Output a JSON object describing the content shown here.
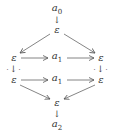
{
  "diagram": {
    "nodes": [
      {
        "id": "a0",
        "label": "a",
        "sub": "0",
        "x": 57,
        "y": 10
      },
      {
        "id": "eps_top",
        "label": "ε",
        "x": 57,
        "y": 30
      },
      {
        "id": "eps_l1",
        "label": "ε",
        "x": 14,
        "y": 58
      },
      {
        "id": "a1_top",
        "label": "a",
        "sub": "1",
        "x": 57,
        "y": 58
      },
      {
        "id": "eps_r1",
        "label": "ε",
        "x": 101,
        "y": 58
      },
      {
        "id": "eps_l2",
        "label": "ε",
        "x": 14,
        "y": 80
      },
      {
        "id": "a1_bot",
        "label": "a",
        "sub": "1",
        "x": 57,
        "y": 80
      },
      {
        "id": "eps_r2",
        "label": "ε",
        "x": 101,
        "y": 80
      },
      {
        "id": "eps_bot",
        "label": "ε",
        "x": 57,
        "y": 103
      },
      {
        "id": "a2",
        "label": "a",
        "sub": "2",
        "x": 57,
        "y": 126
      }
    ],
    "edges": [
      {
        "from": "a0",
        "to": "eps_top",
        "style": "solid"
      },
      {
        "from": "eps_top",
        "to": "eps_l1",
        "style": "solid"
      },
      {
        "from": "eps_top",
        "to": "eps_r1",
        "style": "solid"
      },
      {
        "from": "eps_l1",
        "to": "a1_top",
        "style": "solid"
      },
      {
        "from": "a1_top",
        "to": "eps_r1",
        "style": "solid"
      },
      {
        "from": "eps_l1",
        "to": "eps_l2",
        "style": "dotted"
      },
      {
        "from": "eps_r1",
        "to": "eps_r2",
        "style": "dotted"
      },
      {
        "from": "eps_l2",
        "to": "a1_bot",
        "style": "solid"
      },
      {
        "from": "a1_bot",
        "to": "eps_r2",
        "style": "solid"
      },
      {
        "from": "eps_l2",
        "to": "eps_bot",
        "style": "solid"
      },
      {
        "from": "eps_r2",
        "to": "eps_bot",
        "style": "solid"
      },
      {
        "from": "eps_bot",
        "to": "a2",
        "style": "solid"
      }
    ],
    "labels": {
      "a0": "a",
      "a0_sub": "0",
      "eps": "ε",
      "a1": "a",
      "a1_sub": "1",
      "a2": "a",
      "a2_sub": "2",
      "down_arrow": "↓",
      "dotted_left": "·",
      "dotted_right": "·"
    }
  }
}
